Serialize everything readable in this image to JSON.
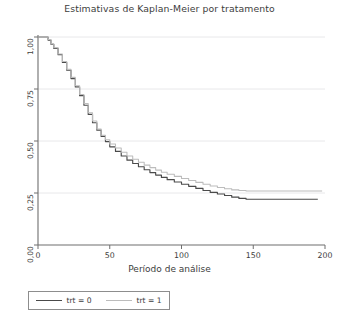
{
  "chart_data": {
    "type": "line",
    "title": "Estimativas de Kaplan-Meier por tratamento",
    "xlabel": "Período de análise",
    "ylabel": "",
    "xlim": [
      0,
      200
    ],
    "ylim": [
      0,
      1
    ],
    "grid": true,
    "grid_axis": "y",
    "legend_position": "below-left",
    "xticks": [
      0,
      50,
      100,
      150,
      200
    ],
    "xtick_labels": [
      "0",
      "50",
      "100",
      "150",
      "200"
    ],
    "yticks": [
      0,
      0.25,
      0.5,
      0.75,
      1
    ],
    "ytick_labels": [
      "0,00",
      "0,25",
      "0,50",
      "0,75",
      "1,00"
    ],
    "series": [
      {
        "name": "trt = 0",
        "label": "trt = 0",
        "color": "#4a4a4a",
        "step": "post",
        "points": [
          [
            0,
            1.0
          ],
          [
            4,
            1.0
          ],
          [
            7,
            0.985
          ],
          [
            9,
            0.965
          ],
          [
            11,
            0.945
          ],
          [
            14,
            0.915
          ],
          [
            17,
            0.878
          ],
          [
            20,
            0.84
          ],
          [
            23,
            0.8
          ],
          [
            26,
            0.76
          ],
          [
            29,
            0.718
          ],
          [
            32,
            0.672
          ],
          [
            35,
            0.628
          ],
          [
            38,
            0.588
          ],
          [
            41,
            0.552
          ],
          [
            44,
            0.522
          ],
          [
            47,
            0.497
          ],
          [
            50,
            0.472
          ],
          [
            54,
            0.45
          ],
          [
            58,
            0.428
          ],
          [
            62,
            0.408
          ],
          [
            66,
            0.392
          ],
          [
            70,
            0.376
          ],
          [
            74,
            0.362
          ],
          [
            78,
            0.348
          ],
          [
            82,
            0.336
          ],
          [
            86,
            0.325
          ],
          [
            90,
            0.314
          ],
          [
            95,
            0.303
          ],
          [
            100,
            0.292
          ],
          [
            105,
            0.282
          ],
          [
            110,
            0.272
          ],
          [
            115,
            0.262
          ],
          [
            120,
            0.253
          ],
          [
            125,
            0.245
          ],
          [
            130,
            0.238
          ],
          [
            135,
            0.23
          ],
          [
            140,
            0.224
          ],
          [
            145,
            0.22
          ],
          [
            150,
            0.22
          ],
          [
            160,
            0.22
          ],
          [
            170,
            0.22
          ],
          [
            183,
            0.22
          ],
          [
            195,
            0.22
          ]
        ]
      },
      {
        "name": "trt = 1",
        "label": "trt = 1",
        "color": "#bcbcbc",
        "step": "post",
        "points": [
          [
            0,
            1.0
          ],
          [
            4,
            1.0
          ],
          [
            7,
            0.988
          ],
          [
            9,
            0.968
          ],
          [
            11,
            0.948
          ],
          [
            14,
            0.918
          ],
          [
            17,
            0.882
          ],
          [
            20,
            0.845
          ],
          [
            23,
            0.806
          ],
          [
            26,
            0.766
          ],
          [
            29,
            0.724
          ],
          [
            32,
            0.68
          ],
          [
            35,
            0.636
          ],
          [
            38,
            0.596
          ],
          [
            41,
            0.558
          ],
          [
            44,
            0.528
          ],
          [
            47,
            0.506
          ],
          [
            50,
            0.486
          ],
          [
            54,
            0.466
          ],
          [
            58,
            0.446
          ],
          [
            62,
            0.428
          ],
          [
            66,
            0.412
          ],
          [
            70,
            0.398
          ],
          [
            74,
            0.384
          ],
          [
            78,
            0.372
          ],
          [
            82,
            0.36
          ],
          [
            86,
            0.35
          ],
          [
            90,
            0.34
          ],
          [
            95,
            0.33
          ],
          [
            100,
            0.32
          ],
          [
            105,
            0.31
          ],
          [
            110,
            0.301
          ],
          [
            115,
            0.292
          ],
          [
            120,
            0.284
          ],
          [
            125,
            0.276
          ],
          [
            130,
            0.27
          ],
          [
            135,
            0.265
          ],
          [
            140,
            0.262
          ],
          [
            145,
            0.26
          ],
          [
            150,
            0.26
          ],
          [
            160,
            0.26
          ],
          [
            170,
            0.26
          ],
          [
            183,
            0.26
          ],
          [
            198,
            0.26
          ]
        ]
      }
    ],
    "colors": {
      "trt0": "#4a4a4a",
      "trt1": "#bcbcbc",
      "axis": "#6e6e6e",
      "grid": "#e8e8ea",
      "text": "#3d3d3d",
      "background": "#ffffff"
    }
  },
  "legend": {
    "entries": [
      {
        "label": "trt = 0"
      },
      {
        "label": "trt = 1"
      }
    ]
  }
}
